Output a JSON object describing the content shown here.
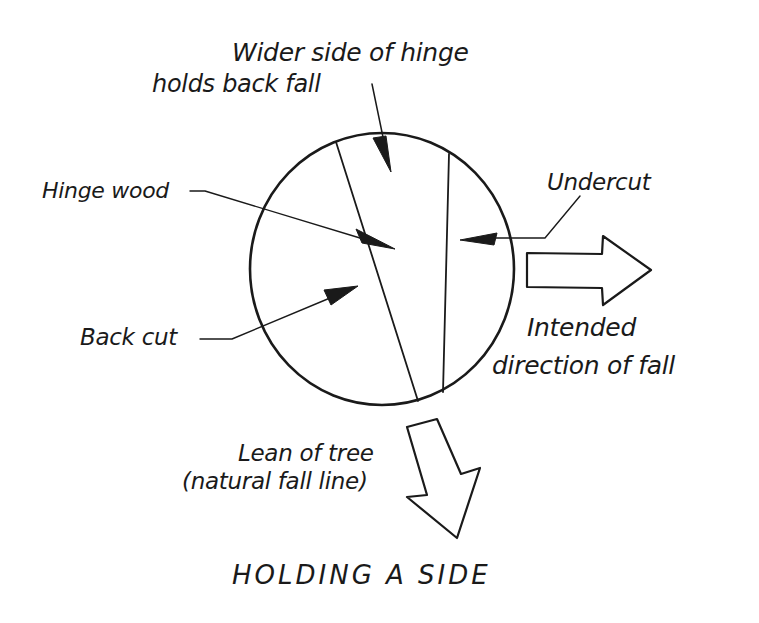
{
  "diagram": {
    "title": "HOLDING A SIDE",
    "labels": {
      "wider_side_line1": "Wider side of hinge",
      "wider_side_line2": "holds back fall",
      "hinge_wood": "Hinge wood",
      "undercut": "Undercut",
      "back_cut": "Back cut",
      "intended_line1": "Intended",
      "intended_line2": "direction of fall",
      "lean_line1": "Lean of tree",
      "lean_line2": "(natural fall line)"
    },
    "elements": {
      "stump": "circle cross-section of tree trunk",
      "back_cut_line": "slanted line through trunk",
      "undercut_line": "near-vertical line toward right side",
      "intended_fall_arrow": "hollow arrow pointing right",
      "lean_arrow": "hollow arrow pointing down-right"
    },
    "colors": {
      "ink": "#1a1a1a",
      "background": "#ffffff"
    }
  }
}
